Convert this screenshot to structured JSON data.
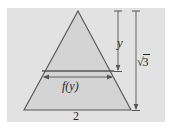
{
  "figure": {
    "panel": {
      "background_color": "#e2e2e2",
      "x": 7,
      "y": 8,
      "width": 158,
      "height": 114
    },
    "colors": {
      "page_background": "#ffffff",
      "panel_fill": "#e2e2e2",
      "triangle_fill": "#d4d4d4",
      "stroke": "#555555",
      "text": "#262626"
    },
    "shape": {
      "type": "triangle",
      "name": "equilateral-triangle",
      "apex": {
        "x": 78,
        "y": 11
      },
      "bottom_left": {
        "x": 24,
        "y": 110
      },
      "bottom_right": {
        "x": 131,
        "y": 110
      }
    },
    "chord": {
      "name": "horizontal-cross-section",
      "y": 71,
      "x_start": 42,
      "x_end": 114
    },
    "labels": {
      "height_partial": "y",
      "height_total_radical": "√",
      "height_total_radicand": "3",
      "cross_section_width": "f(y)",
      "base_length": "2"
    },
    "measurements": [
      {
        "name": "y-measure",
        "label": "y",
        "orientation": "vertical",
        "x": 118,
        "from_y": 11,
        "to_y": 71,
        "value_text": "y"
      },
      {
        "name": "sqrt3-measure",
        "label": "√3",
        "orientation": "vertical",
        "x": 136,
        "from_y": 11,
        "to_y": 110,
        "value_text": "√3"
      },
      {
        "name": "fy-measure",
        "label": "f(y)",
        "orientation": "horizontal",
        "y": 77,
        "from_x": 43,
        "to_x": 113,
        "value_text": "f(y)"
      },
      {
        "name": "base-measure",
        "label": "2",
        "orientation": "horizontal-implicit",
        "y": 110,
        "from_x": 24,
        "to_x": 131,
        "value_text": "2"
      }
    ]
  }
}
